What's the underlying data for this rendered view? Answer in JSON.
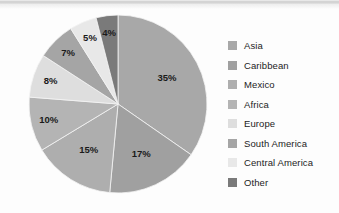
{
  "chart_data": {
    "type": "pie",
    "title": "",
    "xlabel": "",
    "ylabel": "",
    "legend_position": "right",
    "grid": false,
    "start_angle_deg": 0,
    "direction": "clockwise",
    "categories": [
      "Asia",
      "Caribbean",
      "Mexico",
      "Africa",
      "Europe",
      "South America",
      "Central America",
      "Other"
    ],
    "values": [
      35,
      17,
      15,
      10,
      8,
      7,
      5,
      4
    ],
    "value_unit": "%",
    "slice_labels": [
      "35%",
      "17%",
      "15%",
      "10%",
      "8%",
      "7%",
      "5%",
      "4%"
    ],
    "colors": [
      "#a8a8a8",
      "#a0a0a0",
      "#aeaeae",
      "#b4b4b4",
      "#dedede",
      "#a5a5a5",
      "#e8e8e8",
      "#7a7a7a"
    ],
    "slices": [
      {
        "label": "Asia",
        "value": 35,
        "display": "35%",
        "color": "#a8a8a8"
      },
      {
        "label": "Caribbean",
        "value": 17,
        "display": "17%",
        "color": "#a0a0a0"
      },
      {
        "label": "Mexico",
        "value": 15,
        "display": "15%",
        "color": "#aeaeae"
      },
      {
        "label": "Africa",
        "value": 10,
        "display": "10%",
        "color": "#b4b4b4"
      },
      {
        "label": "Europe",
        "value": 8,
        "display": "8%",
        "color": "#dedede"
      },
      {
        "label": "South America",
        "value": 7,
        "display": "7%",
        "color": "#a5a5a5"
      },
      {
        "label": "Central America",
        "value": 5,
        "display": "5%",
        "color": "#e8e8e8"
      },
      {
        "label": "Other",
        "value": 4,
        "display": "4%",
        "color": "#7a7a7a"
      }
    ]
  },
  "legend": {
    "items": [
      {
        "label": "Asia",
        "color": "#a8a8a8"
      },
      {
        "label": "Caribbean",
        "color": "#a0a0a0"
      },
      {
        "label": "Mexico",
        "color": "#aeaeae"
      },
      {
        "label": "Africa",
        "color": "#b4b4b4"
      },
      {
        "label": "Europe",
        "color": "#dedede"
      },
      {
        "label": "South America",
        "color": "#a5a5a5"
      },
      {
        "label": "Central America",
        "color": "#e8e8e8"
      },
      {
        "label": "Other",
        "color": "#7a7a7a"
      }
    ]
  }
}
